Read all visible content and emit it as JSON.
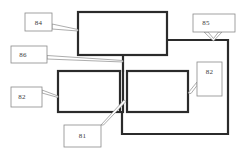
{
  "figure": {
    "type": "patent-block-diagram",
    "background_color": "#ffffff",
    "line_color": "#2b2b2b",
    "callout_line_color": "#8a8a8a",
    "text_color": "#3a3a3a"
  },
  "blocks": [
    {
      "id": "top-unit",
      "name": "upper-block",
      "x": 78,
      "y": 12,
      "width": 89,
      "height": 43,
      "label": ""
    },
    {
      "id": "lower-left-unit",
      "name": "lower-left-block",
      "x": 58,
      "y": 71,
      "width": 62,
      "height": 41,
      "label": ""
    },
    {
      "id": "lower-right-unit",
      "name": "lower-right-block",
      "x": 127,
      "y": 71,
      "width": 61,
      "height": 41,
      "label": ""
    }
  ],
  "callouts": [
    {
      "id": "callout-84",
      "text": "84",
      "box": {
        "x": 25,
        "y": 13,
        "width": 27,
        "height": 18
      },
      "points_to": "upper-block-left-edge"
    },
    {
      "id": "callout-85",
      "text": "85",
      "box": {
        "x": 193,
        "y": 14,
        "width": 42,
        "height": 18
      },
      "points_to": "right-bus-corner"
    },
    {
      "id": "callout-86",
      "text": "86",
      "box": {
        "x": 11,
        "y": 46,
        "width": 36,
        "height": 17
      },
      "points_to": "vertical-interconnect"
    },
    {
      "id": "callout-82-left",
      "text": "82",
      "box": {
        "x": 11,
        "y": 87,
        "width": 31,
        "height": 20
      },
      "points_to": "lower-left-block-left-edge"
    },
    {
      "id": "callout-82-right",
      "text": "82",
      "box": {
        "x": 197,
        "y": 62,
        "width": 25,
        "height": 34
      },
      "points_to": "lower-right-block-right-edge"
    },
    {
      "id": "callout-81",
      "text": "81",
      "box": {
        "x": 64,
        "y": 125,
        "width": 37,
        "height": 22
      },
      "points_to": "inter-block-gap"
    }
  ],
  "connections": [
    {
      "id": "vertical-interconnect",
      "name": "top-to-lower-vertical-bus",
      "from": "upper-block-bottom",
      "to": "lower-blocks-top"
    },
    {
      "id": "right-loop-bus",
      "name": "right-side-loop-bus",
      "from": "upper-block-right",
      "to": "lower-left-block-bottom"
    }
  ]
}
